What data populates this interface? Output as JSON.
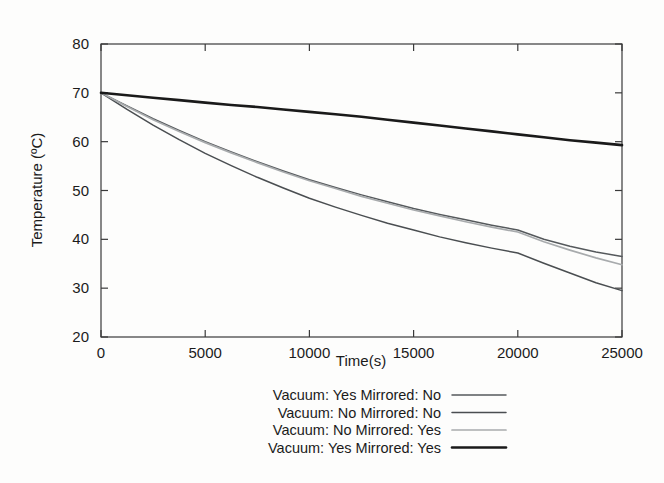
{
  "chart_data": {
    "type": "line",
    "title": "",
    "xlabel": "Time(s)",
    "ylabel": "Temperature (ºC)",
    "xlim": [
      0,
      25000
    ],
    "ylim": [
      20,
      80
    ],
    "xticks": [
      0,
      5000,
      10000,
      15000,
      20000,
      25000
    ],
    "yticks": [
      20,
      30,
      40,
      50,
      60,
      70,
      80
    ],
    "xtick_labels": [
      "0",
      "5000",
      "10000",
      "15000",
      "20000",
      "25000"
    ],
    "ytick_labels": [
      "20",
      "30",
      "40",
      "50",
      "60",
      "70",
      "80"
    ],
    "grid": false,
    "legend_position": "bottom",
    "x": [
      0,
      1250,
      2500,
      3750,
      5000,
      6250,
      7500,
      8750,
      10000,
      11250,
      12500,
      13750,
      15000,
      16250,
      17500,
      18750,
      20000,
      21250,
      22500,
      23750,
      25000
    ],
    "series": [
      {
        "name": "Vacuum: Yes Mirrored: No",
        "color": "#55595c",
        "width": 1.5,
        "values": [
          70.0,
          67.3,
          64.7,
          62.3,
          60.0,
          57.9,
          55.9,
          54.0,
          52.2,
          50.6,
          49.1,
          47.7,
          46.3,
          45.1,
          44.0,
          42.9,
          41.9,
          40.0,
          38.6,
          37.4,
          36.5
        ]
      },
      {
        "name": "Vacuum: No Mirrored: No",
        "color": "#4a4e51",
        "width": 1.5,
        "values": [
          70.0,
          66.6,
          63.4,
          60.4,
          57.6,
          55.1,
          52.7,
          50.5,
          48.4,
          46.6,
          44.9,
          43.3,
          41.9,
          40.5,
          39.3,
          38.2,
          37.2,
          35.1,
          33.1,
          31.1,
          29.5
        ]
      },
      {
        "name": "Vacuum: No Mirrored: Yes",
        "color": "#a8abad",
        "width": 1.7,
        "values": [
          70.0,
          67.2,
          64.5,
          62.1,
          59.8,
          57.7,
          55.7,
          53.8,
          52.0,
          50.4,
          48.8,
          47.4,
          46.0,
          44.8,
          43.6,
          42.5,
          41.5,
          39.5,
          37.8,
          36.2,
          34.8
        ]
      },
      {
        "name": "Vacuum: Yes Mirrored: Yes",
        "color": "#1a1a1a",
        "width": 2.6,
        "values": [
          70.0,
          69.5,
          69.0,
          68.5,
          68.0,
          67.5,
          67.1,
          66.6,
          66.1,
          65.6,
          65.1,
          64.5,
          63.9,
          63.3,
          62.7,
          62.1,
          61.5,
          60.9,
          60.3,
          59.8,
          59.3
        ]
      }
    ]
  },
  "legend": {
    "items": [
      {
        "label": "Vacuum: Yes Mirrored: No"
      },
      {
        "label": "Vacuum: No Mirrored: No"
      },
      {
        "label": "Vacuum: No Mirrored: Yes"
      },
      {
        "label": "Vacuum: Yes Mirrored: Yes"
      }
    ]
  }
}
